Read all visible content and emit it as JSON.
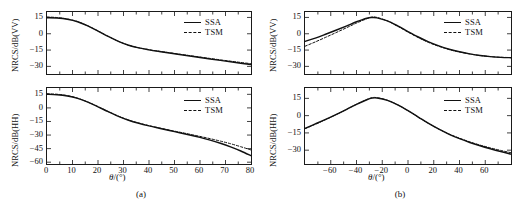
{
  "figure": {
    "caption_a": "(a)",
    "caption_b": "(b)"
  },
  "labels": {
    "xaxis": "θ /(°)",
    "xaxis_symbol": "θ",
    "xaxis_unit": "/(°)",
    "y_vv": "NRCS/dB(VV)",
    "y_hh": "NRCS/dB(HH)",
    "legend_ssa": "SSA",
    "legend_tsm": "TSM"
  },
  "colors": {
    "line": "#111111",
    "axis": "#1a1a1a",
    "background": "#ffffff"
  },
  "chart_data": [
    {
      "id": "a-top",
      "type": "line",
      "title": "",
      "xlabel": "θ /(°)",
      "ylabel": "NRCS/dB(VV)",
      "xlim": [
        0,
        80
      ],
      "ylim": [
        -37,
        20
      ],
      "xticks": [
        0,
        10,
        20,
        30,
        40,
        50,
        60,
        70,
        80
      ],
      "xticklabels": [
        "0",
        "10",
        "20",
        "30",
        "40",
        "50",
        "60",
        "70",
        "80"
      ],
      "yticks": [
        15,
        0,
        -15,
        -30
      ],
      "yticklabels": [
        "15",
        "0",
        "-15",
        "-30"
      ],
      "grid": false,
      "legend_position": "top-right",
      "series": [
        {
          "name": "SSA",
          "style": "solid",
          "x": [
            0,
            4,
            8,
            12,
            16,
            20,
            24,
            28,
            32,
            36,
            40,
            44,
            48,
            52,
            56,
            60,
            64,
            68,
            72,
            76,
            80
          ],
          "values": [
            14.7,
            14.4,
            13.3,
            11.0,
            7.2,
            2.5,
            -2.5,
            -7.0,
            -10.6,
            -13.0,
            -14.8,
            -16.3,
            -17.7,
            -19.1,
            -20.5,
            -21.9,
            -23.2,
            -24.5,
            -25.8,
            -27.1,
            -28.3
          ]
        },
        {
          "name": "TSM",
          "style": "dashed",
          "x": [
            0,
            4,
            8,
            12,
            16,
            20,
            24,
            28,
            32,
            36,
            40,
            44,
            48,
            52,
            56,
            60,
            64,
            68,
            72,
            76,
            80
          ],
          "values": [
            15.4,
            14.9,
            13.6,
            11.2,
            7.3,
            2.6,
            -2.4,
            -6.9,
            -10.5,
            -12.9,
            -14.6,
            -16.1,
            -17.4,
            -18.8,
            -20.1,
            -21.4,
            -22.7,
            -24.0,
            -25.2,
            -26.4,
            -27.5
          ]
        }
      ]
    },
    {
      "id": "a-bottom",
      "type": "line",
      "title": "",
      "xlabel": "θ /(°)",
      "ylabel": "NRCS/dB(HH)",
      "xlim": [
        0,
        80
      ],
      "ylim": [
        -62,
        22
      ],
      "xticks": [
        0,
        10,
        20,
        30,
        40,
        50,
        60,
        70,
        80
      ],
      "xticklabels": [
        "0",
        "10",
        "20",
        "30",
        "40",
        "50",
        "60",
        "70",
        "80"
      ],
      "yticks": [
        15,
        0,
        -15,
        -30,
        -45,
        -60
      ],
      "yticklabels": [
        "15",
        "0",
        "-15",
        "-30",
        "-45",
        "-60"
      ],
      "grid": false,
      "legend_position": "top-right",
      "series": [
        {
          "name": "SSA",
          "style": "solid",
          "x": [
            0,
            4,
            8,
            12,
            16,
            20,
            24,
            28,
            32,
            36,
            40,
            44,
            48,
            52,
            56,
            60,
            64,
            68,
            72,
            76,
            80
          ],
          "values": [
            15.0,
            14.6,
            13.2,
            10.5,
            6.3,
            1.2,
            -4.2,
            -9.3,
            -13.6,
            -17.0,
            -19.9,
            -22.5,
            -25.0,
            -27.4,
            -29.9,
            -32.6,
            -35.6,
            -39.0,
            -43.0,
            -47.6,
            -52.8
          ]
        },
        {
          "name": "TSM",
          "style": "dashed",
          "x": [
            0,
            4,
            8,
            12,
            16,
            20,
            24,
            28,
            32,
            36,
            40,
            44,
            48,
            52,
            56,
            60,
            64,
            68,
            72,
            76,
            80
          ],
          "values": [
            15.6,
            15.1,
            13.6,
            10.8,
            6.5,
            1.4,
            -4.0,
            -9.1,
            -13.4,
            -16.8,
            -19.6,
            -22.1,
            -24.5,
            -26.8,
            -29.1,
            -31.5,
            -34.0,
            -36.7,
            -39.6,
            -42.9,
            -46.5
          ]
        }
      ]
    },
    {
      "id": "b-top",
      "type": "line",
      "title": "",
      "xlabel": "θ /(°)",
      "ylabel": "NRCS/dB(VV)",
      "xlim": [
        -80,
        80
      ],
      "ylim": [
        -37,
        20
      ],
      "xticks": [
        -60,
        -40,
        -20,
        0,
        20,
        40,
        60
      ],
      "xticklabels": [
        "-60",
        "-40",
        "-20",
        "0",
        "20",
        "40",
        "60"
      ],
      "yticks": [
        15,
        0,
        -15,
        -30
      ],
      "yticklabels": [
        "15",
        "0",
        "-15",
        "-30"
      ],
      "grid": false,
      "legend_position": "top-right",
      "series": [
        {
          "name": "SSA",
          "style": "solid",
          "x": [
            -80,
            -72,
            -64,
            -56,
            -48,
            -40,
            -32,
            -28,
            -24,
            -16,
            -8,
            0,
            8,
            16,
            24,
            32,
            40,
            48,
            56,
            64,
            72,
            80
          ],
          "values": [
            -7.0,
            -4.0,
            -0.5,
            3.2,
            7.0,
            11.0,
            14.3,
            14.9,
            14.6,
            11.8,
            7.2,
            2.0,
            -3.0,
            -7.5,
            -11.2,
            -14.2,
            -16.6,
            -18.5,
            -20.0,
            -21.0,
            -21.7,
            -22.0
          ]
        },
        {
          "name": "TSM",
          "style": "dashed",
          "x": [
            -80,
            -72,
            -64,
            -56,
            -48,
            -40,
            -32,
            -28,
            -24,
            -16,
            -8,
            0,
            8,
            16,
            24,
            32,
            40,
            48,
            56,
            64,
            72,
            80
          ],
          "values": [
            -11.5,
            -7.5,
            -3.3,
            1.0,
            5.4,
            9.8,
            13.8,
            15.3,
            15.0,
            11.8,
            6.9,
            1.5,
            -3.5,
            -8.0,
            -11.6,
            -14.5,
            -16.8,
            -18.6,
            -20.0,
            -21.0,
            -21.6,
            -21.9
          ]
        }
      ]
    },
    {
      "id": "b-bottom",
      "type": "line",
      "title": "",
      "xlabel": "θ /(°)",
      "ylabel": "NRCS/dB(HH)",
      "xlim": [
        -80,
        80
      ],
      "ylim": [
        -42,
        24
      ],
      "xticks": [
        -60,
        -40,
        -20,
        0,
        20,
        40,
        60
      ],
      "xticklabels": [
        "-60",
        "-40",
        "-20",
        "0",
        "20",
        "40",
        "60"
      ],
      "yticks": [
        15,
        0,
        -15,
        -30
      ],
      "yticklabels": [
        "15",
        "0",
        "-15",
        "-30"
      ],
      "grid": false,
      "legend_position": "top-right",
      "series": [
        {
          "name": "SSA",
          "style": "solid",
          "x": [
            -80,
            -72,
            -64,
            -56,
            -48,
            -40,
            -32,
            -28,
            -24,
            -16,
            -8,
            0,
            8,
            16,
            24,
            32,
            40,
            48,
            56,
            64,
            72,
            80
          ],
          "values": [
            -11.0,
            -7.2,
            -3.3,
            0.9,
            5.3,
            9.8,
            13.8,
            15.2,
            15.3,
            13.3,
            9.4,
            4.4,
            -1.2,
            -6.8,
            -11.8,
            -16.2,
            -20.0,
            -23.3,
            -26.2,
            -28.8,
            -31.2,
            -33.4
          ]
        },
        {
          "name": "TSM",
          "style": "dashed",
          "x": [
            -80,
            -72,
            -64,
            -56,
            -48,
            -40,
            -32,
            -28,
            -24,
            -16,
            -8,
            0,
            8,
            16,
            24,
            32,
            40,
            48,
            56,
            64,
            72,
            80
          ],
          "values": [
            -11.4,
            -7.5,
            -3.5,
            0.8,
            5.3,
            9.9,
            14.0,
            15.6,
            15.6,
            13.4,
            9.4,
            4.3,
            -1.3,
            -6.8,
            -11.7,
            -16.0,
            -19.6,
            -22.8,
            -25.6,
            -28.0,
            -30.2,
            -32.2
          ]
        }
      ]
    }
  ]
}
